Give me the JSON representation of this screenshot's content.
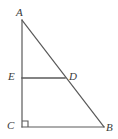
{
  "figure": {
    "name": "right-triangle-with-midsegment",
    "background_color": "#ffffff",
    "stroke_color": "#5a5a5a",
    "label_color": "#3a3a3a",
    "stroke_width": 1.2,
    "width": 118,
    "height": 139
  },
  "labels": {
    "A": "A",
    "B": "B",
    "C": "C",
    "D": "D",
    "E": "E"
  },
  "points": {
    "A": {
      "x": 22,
      "y": 20
    },
    "B": {
      "x": 104,
      "y": 127
    },
    "C": {
      "x": 22,
      "y": 127
    },
    "D": {
      "x": 65,
      "y": 78
    },
    "E": {
      "x": 22,
      "y": 78
    }
  },
  "segments": [
    {
      "name": "AC",
      "from": "A",
      "to": "C"
    },
    {
      "name": "CB",
      "from": "C",
      "to": "B"
    },
    {
      "name": "AB",
      "from": "A",
      "to": "B"
    },
    {
      "name": "ED",
      "from": "E",
      "to": "D"
    }
  ],
  "right_angle": {
    "at": "C",
    "marker": "square",
    "size": 6
  }
}
